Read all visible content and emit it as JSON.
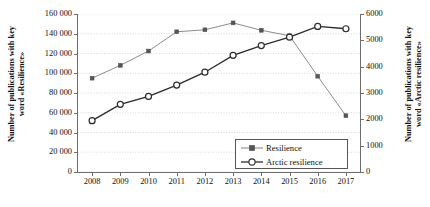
{
  "chart_data": {
    "type": "line",
    "title": "",
    "xlabel": "",
    "categories": [
      "2008",
      "2009",
      "2010",
      "2011",
      "2012",
      "2013",
      "2014",
      "2015",
      "2016",
      "2017"
    ],
    "grid": true,
    "legend_position": "inside-bottom-right",
    "series": [
      {
        "name": "Resilience",
        "axis": "left",
        "color": "#8c8c8c",
        "marker": "filled-square",
        "values": [
          95000,
          108000,
          122500,
          142000,
          144000,
          151000,
          143500,
          138000,
          97000,
          57000
        ]
      },
      {
        "name": "Arctic resilience",
        "axis": "right",
        "color": "#2b2b2b",
        "marker": "open-circle",
        "values": [
          1950,
          2570,
          2870,
          3300,
          3790,
          4430,
          4800,
          5120,
          5530,
          5440
        ]
      }
    ],
    "y_left": {
      "label": "Number of publications with key\nword «Resilience»",
      "min": 0,
      "max": 160000,
      "step": 20000,
      "ticks": [
        "0",
        "20 000",
        "40 000",
        "60 000",
        "80 000",
        "100 000",
        "120 000",
        "140 000",
        "160 000"
      ]
    },
    "y_right": {
      "label": "Number of publications with key\nword «Arctic resilience»",
      "min": 0,
      "max": 6000,
      "step": 1000,
      "ticks": [
        "0",
        "1000",
        "2000",
        "3000",
        "4000",
        "5000",
        "6000"
      ]
    }
  },
  "legend": {
    "items": [
      {
        "label": "Resilience"
      },
      {
        "label": "Arctic resilience"
      }
    ]
  },
  "colors": {
    "series_resilience": "#8c8c8c",
    "series_arctic": "#2b2b2b",
    "axis": "#6e6e6e",
    "grid": "#c8c8c8",
    "background": "#ffffff"
  }
}
